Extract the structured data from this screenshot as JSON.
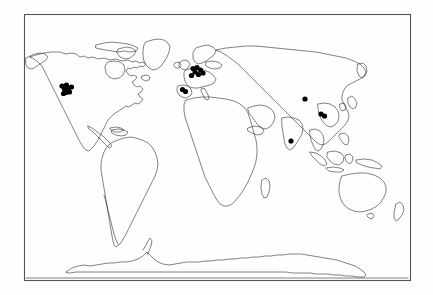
{
  "figure": {
    "background_color": "#fefefe",
    "frame_color": "#555555",
    "coastline_color": "#1b1b1b",
    "marker_color": "#000000",
    "projection": "equirectangular",
    "frame": {
      "left": 24,
      "top": 14,
      "right": 410,
      "bottom": 280
    },
    "canvas": {
      "width": 433,
      "height": 295
    }
  },
  "legend": {
    "present": false,
    "entries": []
  },
  "axes": {
    "visible": false,
    "tick_labels": [],
    "gridlines": false
  },
  "chart_data": {
    "type": "scatter",
    "xlabel": "",
    "ylabel": "",
    "xlim": [
      24,
      410
    ],
    "ylim": [
      14,
      280
    ],
    "grid": false,
    "legend_position": "none",
    "marker_shape": "filled-circle",
    "marker_color": "#000000",
    "marker_radius_px": 2.6,
    "regions": [
      {
        "name": "Western North America",
        "count": 8,
        "points": [
          {
            "x": 62.0,
            "y": 86.0
          },
          {
            "x": 66.5,
            "y": 85.0
          },
          {
            "x": 64.5,
            "y": 89.0
          },
          {
            "x": 68.5,
            "y": 88.5
          },
          {
            "x": 71.5,
            "y": 87.0
          },
          {
            "x": 66.0,
            "y": 92.5
          },
          {
            "x": 69.5,
            "y": 92.0
          },
          {
            "x": 63.5,
            "y": 93.5
          }
        ]
      },
      {
        "name": "Western and Central Europe",
        "count": 7,
        "points": [
          {
            "x": 193.0,
            "y": 68.5
          },
          {
            "x": 197.0,
            "y": 67.5
          },
          {
            "x": 200.5,
            "y": 70.0
          },
          {
            "x": 195.0,
            "y": 72.0
          },
          {
            "x": 198.5,
            "y": 74.5
          },
          {
            "x": 203.0,
            "y": 73.0
          },
          {
            "x": 191.5,
            "y": 75.5
          }
        ]
      },
      {
        "name": "Iberian Peninsula",
        "count": 2,
        "points": [
          {
            "x": 182.5,
            "y": 89.5
          },
          {
            "x": 185.5,
            "y": 91.5
          }
        ]
      },
      {
        "name": "Central Asia",
        "count": 1,
        "points": [
          {
            "x": 305.0,
            "y": 99.0
          }
        ]
      },
      {
        "name": "Eastern China",
        "count": 2,
        "points": [
          {
            "x": 321.0,
            "y": 114.0
          },
          {
            "x": 324.5,
            "y": 116.0
          }
        ]
      },
      {
        "name": "India",
        "count": 1,
        "points": [
          {
            "x": 291.0,
            "y": 141.0
          }
        ]
      }
    ],
    "total_points": 21,
    "empty_regions": [
      "South America",
      "Africa",
      "Australia",
      "Antarctica",
      "Southeast Asia"
    ]
  }
}
